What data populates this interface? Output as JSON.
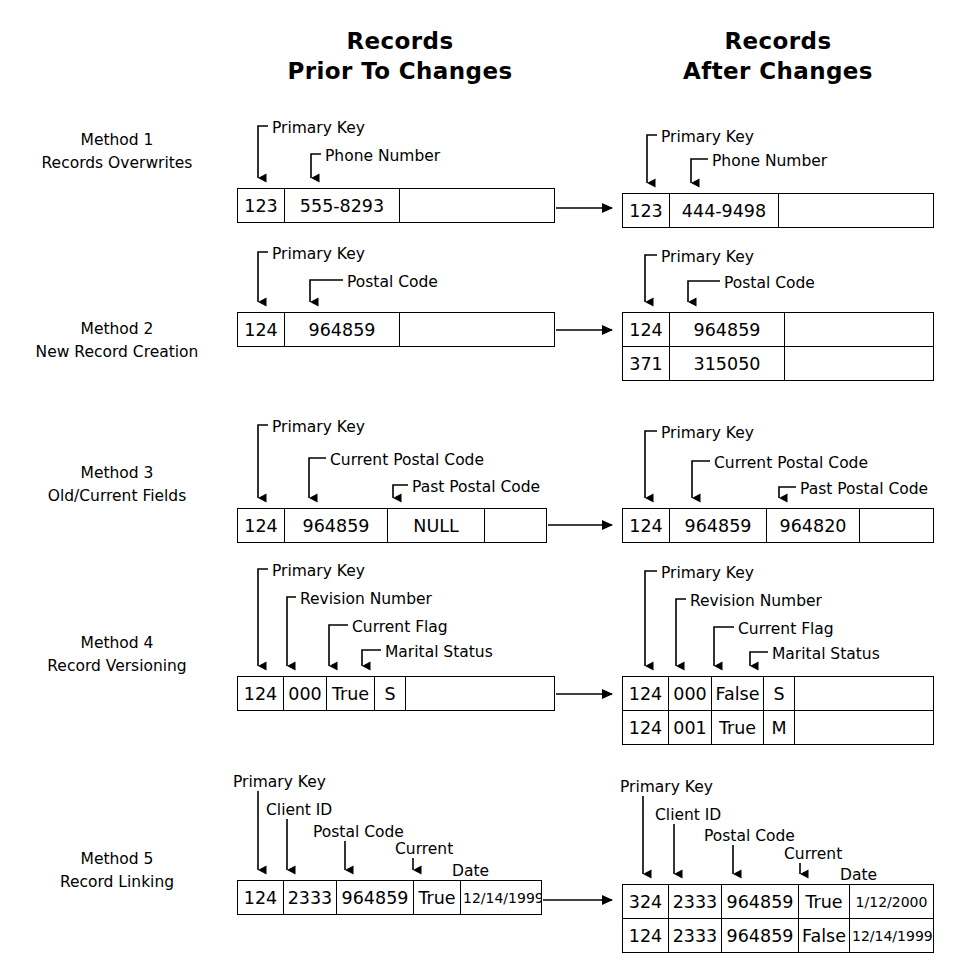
{
  "headers": {
    "before": "Records\nPrior To Changes",
    "after": "Records\nAfter Changes"
  },
  "methods": [
    {
      "id": "method-1",
      "label": "Method 1\nRecords Overwrites",
      "before": {
        "callouts": [
          "Primary Key",
          "Phone Number"
        ],
        "rows": [
          [
            "123",
            "555-8293",
            ""
          ]
        ]
      },
      "after": {
        "callouts": [
          "Primary Key",
          "Phone Number"
        ],
        "rows": [
          [
            "123",
            "444-9498",
            ""
          ]
        ]
      }
    },
    {
      "id": "method-2",
      "label": "Method 2\nNew Record Creation",
      "before": {
        "callouts": [
          "Primary Key",
          "Postal Code"
        ],
        "rows": [
          [
            "124",
            "964859",
            ""
          ]
        ]
      },
      "after": {
        "callouts": [
          "Primary Key",
          "Postal Code"
        ],
        "rows": [
          [
            "124",
            "964859",
            ""
          ],
          [
            "371",
            "315050",
            ""
          ]
        ]
      }
    },
    {
      "id": "method-3",
      "label": "Method 3\nOld/Current Fields",
      "before": {
        "callouts": [
          "Primary Key",
          "Current Postal Code",
          "Past Postal Code"
        ],
        "rows": [
          [
            "124",
            "964859",
            "NULL",
            ""
          ]
        ]
      },
      "after": {
        "callouts": [
          "Primary Key",
          "Current Postal Code",
          "Past Postal Code"
        ],
        "rows": [
          [
            "124",
            "964859",
            "964820",
            ""
          ]
        ]
      }
    },
    {
      "id": "method-4",
      "label": "Method 4\nRecord Versioning",
      "before": {
        "callouts": [
          "Primary Key",
          "Revision Number",
          "Current Flag",
          "Marital Status"
        ],
        "rows": [
          [
            "124",
            "000",
            "True",
            "S",
            ""
          ]
        ]
      },
      "after": {
        "callouts": [
          "Primary Key",
          "Revision Number",
          "Current Flag",
          "Marital Status"
        ],
        "rows": [
          [
            "124",
            "000",
            "False",
            "S",
            ""
          ],
          [
            "124",
            "001",
            "True",
            "M",
            ""
          ]
        ]
      }
    },
    {
      "id": "method-5",
      "label": "Method 5\nRecord Linking",
      "before": {
        "callouts": [
          "Primary Key",
          "Client ID",
          "Postal Code",
          "Current",
          "Date"
        ],
        "rows": [
          [
            "124",
            "2333",
            "964859",
            "True",
            "12/14/1999"
          ]
        ]
      },
      "after": {
        "callouts": [
          "Primary Key",
          "Client ID",
          "Postal Code",
          "Current",
          "Date"
        ],
        "rows": [
          [
            "324",
            "2333",
            "964859",
            "True",
            "1/12/2000"
          ],
          [
            "124",
            "2333",
            "964859",
            "False",
            "12/14/1999"
          ]
        ]
      }
    }
  ],
  "colors": {
    "ink": "#000000",
    "paper": "#ffffff"
  }
}
